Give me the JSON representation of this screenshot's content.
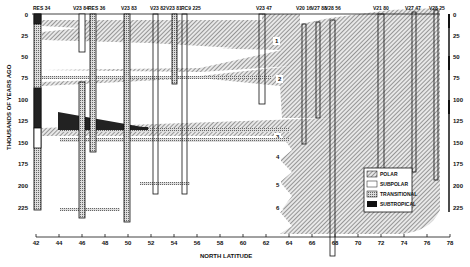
{
  "figure": {
    "y_axis_label": "THOUSANDS OF YEARS AGO",
    "x_axis_label": "NORTH LATITUDE",
    "y_ticks": [
      "0",
      "25",
      "50",
      "75",
      "100",
      "125",
      "150",
      "175",
      "200",
      "225"
    ],
    "x_ticks": [
      "42",
      "44",
      "46",
      "48",
      "50",
      "52",
      "54",
      "56",
      "58",
      "60",
      "62",
      "64",
      "66",
      "68",
      "70",
      "72",
      "74",
      "76",
      "78"
    ],
    "cores": [
      {
        "name": "RES 34",
        "x": 38
      },
      {
        "name": "V23 84",
        "x": 82
      },
      {
        "name": "RES 36",
        "x": 95
      },
      {
        "name": "V23 83",
        "x": 128
      },
      {
        "name": "V23 82",
        "x": 156
      },
      {
        "name": "V23 81",
        "x": 173
      },
      {
        "name": "RC9 225",
        "x": 185
      },
      {
        "name": "V23 47",
        "x": 262
      },
      {
        "name": "V20 16",
        "x": 304
      },
      {
        "name": "V27 88",
        "x": 318
      },
      {
        "name": "V28 56",
        "x": 332
      },
      {
        "name": "V21 80",
        "x": 380
      },
      {
        "name": "V27 47",
        "x": 413
      },
      {
        "name": "V28 25",
        "x": 437
      }
    ],
    "tongue_labels": [
      "1",
      "2",
      "3",
      "4",
      "5",
      "6"
    ],
    "legend": [
      {
        "label": "POLAR",
        "pattern": "hatch"
      },
      {
        "label": "SUBPOLAR",
        "pattern": "white"
      },
      {
        "label": "TRANSITIONAL",
        "pattern": "stipple"
      },
      {
        "label": "SUBTROPICAL",
        "pattern": "black"
      }
    ],
    "colors": {
      "ink": "#111111",
      "paper": "#ffffff"
    }
  }
}
